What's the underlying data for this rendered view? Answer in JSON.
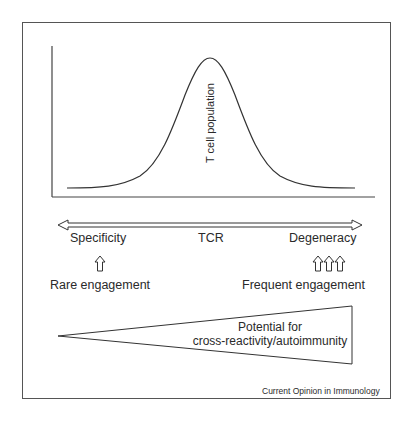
{
  "figure": {
    "curve_label": "T cell population",
    "axis": {
      "center_label": "TCR",
      "left_label": "Specificity",
      "right_label": "Degeneracy"
    },
    "engagement": {
      "left_label": "Rare engagement",
      "left_arrow_count": 1,
      "right_label": "Frequent engagement",
      "right_arrow_count": 3
    },
    "wedge": {
      "line1": "Potential for",
      "line2": "cross-reactivity/autoimmunity"
    },
    "credit": "Current Opinion in Immunology"
  },
  "colors": {
    "line": "#333333",
    "background": "#ffffff",
    "text": "#2a2a2a"
  }
}
